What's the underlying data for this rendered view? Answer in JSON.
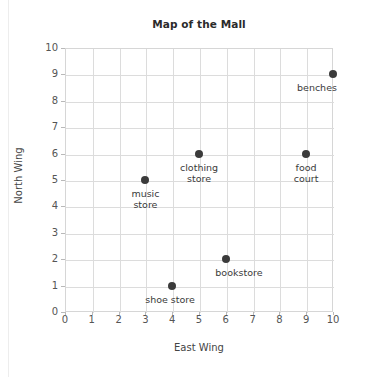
{
  "chart_data": {
    "type": "scatter",
    "title": "Map of the Mall",
    "xlabel": "East Wing",
    "ylabel": "North Wing",
    "xlim": [
      0,
      10
    ],
    "ylim": [
      0,
      10
    ],
    "xticks": [
      "0",
      "1",
      "2",
      "3",
      "4",
      "5",
      "6",
      "7",
      "8",
      "9",
      "10"
    ],
    "yticks": [
      "0",
      "1",
      "2",
      "3",
      "4",
      "5",
      "6",
      "7",
      "8",
      "9",
      "10"
    ],
    "grid": true,
    "legend": "none",
    "marker_color": "#3b3b3b",
    "grid_color": "#dcdcdc",
    "points": [
      {
        "label": "music\nstore",
        "x": 3,
        "y": 5,
        "label_dx": 0,
        "label_dy": 8,
        "align": "center"
      },
      {
        "label": "clothing\nstore",
        "x": 5,
        "y": 6,
        "label_dx": 0,
        "label_dy": 8,
        "align": "center"
      },
      {
        "label": "shoe store",
        "x": 4,
        "y": 1,
        "label_dx": -2,
        "label_dy": 8,
        "align": "center"
      },
      {
        "label": "bookstore",
        "x": 6,
        "y": 2,
        "label_dx": 13,
        "label_dy": 8,
        "align": "center"
      },
      {
        "label": "food\ncourt",
        "x": 9,
        "y": 6,
        "label_dx": 0,
        "label_dy": 8,
        "align": "center"
      },
      {
        "label": "benches",
        "x": 10,
        "y": 9,
        "label_dx": -16,
        "label_dy": 8,
        "align": "center"
      }
    ]
  }
}
